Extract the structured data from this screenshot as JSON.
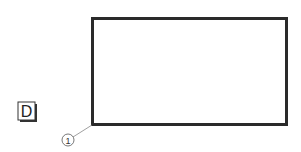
{
  "diagram": {
    "label_box": {
      "text": "D"
    },
    "callout": {
      "text": "1"
    },
    "colors": {
      "stroke": "#2a2a2a",
      "leader": "#888888",
      "background": "#ffffff"
    }
  }
}
